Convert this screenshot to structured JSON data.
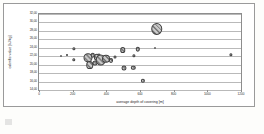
{
  "figure": {
    "kind": "bubble-chart",
    "background_color": "#ffffff",
    "frame_color": "#9a9a9a",
    "bubble_fill": "#b6b6b6",
    "bubble_stroke": "#404040",
    "gridline_color": "#b9b9b9"
  },
  "chart_data": {
    "type": "scatter",
    "title": "",
    "subtitle": "",
    "xlabel": "average depth of covering [m]",
    "ylabel": "calorific value [kJ/kg]",
    "xlim": [
      0,
      1200
    ],
    "ylim": [
      14.0,
      32.0
    ],
    "xticks": [
      0,
      200,
      400,
      600,
      800,
      1000,
      1200
    ],
    "xtick_labels": [
      "0",
      "200",
      "400",
      "600",
      "800",
      "1000",
      "1200"
    ],
    "yticks": [
      14.0,
      16.0,
      18.0,
      20.0,
      22.0,
      24.0,
      26.0,
      28.0,
      30.0,
      32.0
    ],
    "ytick_labels": [
      "14,00",
      "16,00",
      "18,00",
      "20,00",
      "22,00",
      "24,00",
      "26,00",
      "28,00",
      "30,00",
      "32,00"
    ],
    "grid": "horizontal",
    "legend": "none",
    "size_encoding": "bubble area (unlabelled third variable)",
    "points": [
      {
        "x": 130,
        "y": 22.0,
        "size": 1.2
      },
      {
        "x": 168,
        "y": 22.3,
        "size": 2.0
      },
      {
        "x": 205,
        "y": 23.8,
        "size": 3.2
      },
      {
        "x": 208,
        "y": 21.2,
        "size": 3.4
      },
      {
        "x": 292,
        "y": 21.6,
        "size": 9.0
      },
      {
        "x": 300,
        "y": 20.0,
        "size": 7.5
      },
      {
        "x": 318,
        "y": 22.3,
        "size": 4.5
      },
      {
        "x": 330,
        "y": 20.4,
        "size": 5.0
      },
      {
        "x": 342,
        "y": 21.8,
        "size": 6.2
      },
      {
        "x": 355,
        "y": 22.3,
        "size": 3.0
      },
      {
        "x": 368,
        "y": 21.0,
        "size": 10.5
      },
      {
        "x": 396,
        "y": 21.4,
        "size": 8.0
      },
      {
        "x": 430,
        "y": 21.0,
        "size": 4.0
      },
      {
        "x": 452,
        "y": 21.9,
        "size": 3.0
      },
      {
        "x": 498,
        "y": 23.4,
        "size": 5.5
      },
      {
        "x": 505,
        "y": 19.3,
        "size": 5.0
      },
      {
        "x": 560,
        "y": 19.3,
        "size": 4.4
      },
      {
        "x": 562,
        "y": 22.1,
        "size": 3.2
      },
      {
        "x": 588,
        "y": 23.6,
        "size": 4.4
      },
      {
        "x": 618,
        "y": 16.2,
        "size": 4.2
      },
      {
        "x": 690,
        "y": 23.9,
        "size": 1.4
      },
      {
        "x": 700,
        "y": 28.5,
        "size": 11.5
      },
      {
        "x": 1140,
        "y": 22.4,
        "size": 3.2
      }
    ]
  }
}
